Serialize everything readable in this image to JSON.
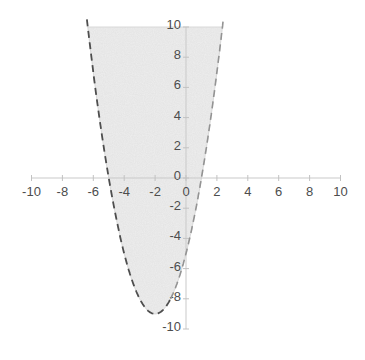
{
  "chart_data": {
    "type": "area",
    "title": "",
    "xlabel": "",
    "ylabel": "",
    "grid": false,
    "legend": false,
    "region_inequality": "y > x^2 + 4x - 5",
    "boundary": {
      "equation": "y = x^2 + 4x - 5",
      "coefficients": {
        "a": 1,
        "b": 4,
        "c": -5
      },
      "vertex": [
        -2,
        -9
      ],
      "x_intercepts": [
        -5,
        1
      ],
      "y_intercept": [
        0,
        -5
      ],
      "line_style": "dashed",
      "clipped_at_top_y": 10
    },
    "boundary_points": [
      [
        -6.36,
        10
      ],
      [
        -6,
        7
      ],
      [
        -5.5,
        3.25
      ],
      [
        -5,
        0
      ],
      [
        -4.5,
        -2.75
      ],
      [
        -4,
        -5
      ],
      [
        -3.5,
        -6.75
      ],
      [
        -3,
        -8
      ],
      [
        -2.5,
        -8.75
      ],
      [
        -2,
        -9
      ],
      [
        -1.5,
        -8.75
      ],
      [
        -1,
        -8
      ],
      [
        -0.5,
        -6.75
      ],
      [
        0,
        -5
      ],
      [
        0.5,
        -2.75
      ],
      [
        1,
        0
      ],
      [
        1.5,
        3.25
      ],
      [
        2,
        7
      ],
      [
        2.36,
        10
      ]
    ],
    "x_axis": {
      "min": -10,
      "max": 10,
      "tick_step": 2,
      "tick_labels": [
        "-10",
        "-8",
        "-6",
        "-4",
        "-2",
        "0",
        "2",
        "4",
        "6",
        "8",
        "10"
      ]
    },
    "y_axis": {
      "min": -10,
      "max": 10,
      "tick_step": 2,
      "tick_labels": [
        "10",
        "8",
        "6",
        "4",
        "2",
        "0",
        "-2",
        "-4",
        "-6",
        "-8",
        "-10"
      ]
    }
  },
  "colors": {
    "background": "#ffffff",
    "region_fill": "#eeeeee",
    "region_edge": "#d8d8d8",
    "boundary_dash_dark": "#4e4e4e",
    "boundary_dash_light": "#939393",
    "axis_line": "#c9c9c9",
    "tick_mark": "#c2c2c2",
    "tick_label": "#4d4d4d"
  }
}
